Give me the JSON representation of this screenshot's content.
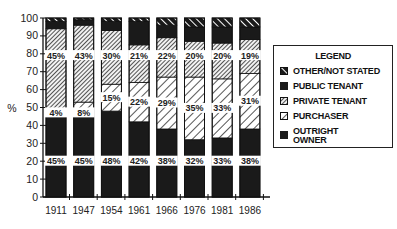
{
  "chart_data": {
    "type": "bar",
    "stacked": true,
    "title": "",
    "xlabel": "",
    "ylabel": "%",
    "ylim": [
      0,
      100
    ],
    "yticks": [
      0,
      10,
      20,
      30,
      40,
      50,
      60,
      70,
      80,
      90,
      100
    ],
    "categories": [
      "1911",
      "1947",
      "1954",
      "1961",
      "1966",
      "1976",
      "1981",
      "1986"
    ],
    "series": [
      {
        "name": "OUTRIGHT OWNER",
        "pattern": "solid-dark",
        "values": [
          45,
          45,
          48,
          42,
          38,
          32,
          33,
          38
        ],
        "labels": [
          "45%",
          "45%",
          "48%",
          "42%",
          "38%",
          "32%",
          "33%",
          "38%"
        ]
      },
      {
        "name": "PURCHASER",
        "pattern": "wide-hatch",
        "values": [
          4,
          8,
          15,
          22,
          29,
          35,
          33,
          31
        ],
        "labels": [
          "4%",
          "8%",
          "15%",
          "22%",
          "29%",
          "35%",
          "33%",
          "31%"
        ]
      },
      {
        "name": "PRIVATE TENANT",
        "pattern": "dense-hatch",
        "values": [
          45,
          43,
          30,
          21,
          22,
          20,
          20,
          19
        ],
        "labels": [
          "45%",
          "43%",
          "30%",
          "21%",
          "22%",
          "20%",
          "20%",
          "19%"
        ]
      },
      {
        "name": "PUBLIC TENANT",
        "pattern": "solid-dark",
        "values": [
          4,
          3,
          5,
          13,
          7,
          8,
          9,
          7
        ],
        "labels": []
      },
      {
        "name": "OTHER/NOT STATED",
        "pattern": "bold-stripe",
        "values": [
          2,
          1,
          2,
          2,
          4,
          5,
          5,
          5
        ],
        "labels": []
      }
    ],
    "label_positions_pct": {
      "OUTRIGHT OWNER": 20,
      "PRIVATE TENANT": 79
    },
    "grid": false,
    "legend": {
      "title": "LEGEND",
      "placement": "right",
      "entries": [
        "OTHER/NOT STATED",
        "PUBLIC TENANT",
        "PRIVATE TENANT",
        "PURCHASER",
        "OUTRIGHT OWNER"
      ]
    },
    "colors": {
      "dark": "#1a1a1a",
      "hatch": "#333333",
      "background": "#ffffff"
    }
  }
}
